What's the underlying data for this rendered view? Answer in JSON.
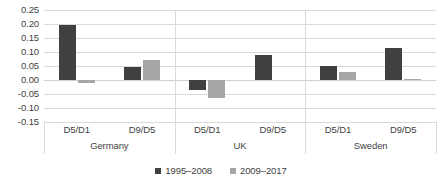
{
  "chart_data": {
    "type": "bar",
    "title": "",
    "subtitle": "",
    "xlabel": "",
    "ylabel": "",
    "ylim": [
      -0.15,
      0.25
    ],
    "ytick_step": 0.05,
    "grid": true,
    "legend_position": "bottom",
    "yticks": [
      "0.25",
      "0.20",
      "0.15",
      "0.10",
      "0.05",
      "0.00",
      "-0.05",
      "-0.10",
      "-0.15"
    ],
    "ytick_values": [
      0.25,
      0.2,
      0.15,
      0.1,
      0.05,
      0.0,
      -0.05,
      -0.1,
      -0.15
    ],
    "groups": [
      "Germany",
      "UK",
      "Sweden"
    ],
    "categories": [
      "D5/D1",
      "D9/D5",
      "D5/D1",
      "D9/D5",
      "D5/D1",
      "D9/D5"
    ],
    "series": [
      {
        "name": "1995–2008",
        "color": "#404040",
        "values": [
          0.195,
          0.045,
          -0.035,
          0.09,
          0.05,
          0.115
        ]
      },
      {
        "name": "2009–2017",
        "color": "#a6a6a6",
        "values": [
          -0.01,
          0.07,
          -0.065,
          0.0,
          0.03,
          0.005
        ]
      }
    ]
  },
  "colors": {
    "series_a": "#404040",
    "series_b": "#a6a6a6",
    "gridline": "#d9d9d9",
    "text": "#3f3f3f",
    "background": "#ffffff"
  }
}
